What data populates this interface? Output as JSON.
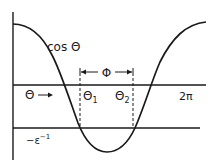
{
  "diagram": {
    "type": "cosine-threshold-plot",
    "curve_label": "cos Θ",
    "axis_variable_label": "Θ",
    "axis_variable_arrow": "→",
    "axis_end_label": "2π",
    "threshold_label": "−ε⁻¹",
    "phase_width_label": "Φ",
    "crossing_labels": [
      "Θ₁",
      "Θ₂"
    ],
    "colors": {
      "line": "#1a1a1a",
      "background": "#ffffff"
    }
  }
}
